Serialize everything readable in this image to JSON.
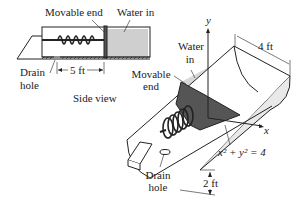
{
  "side_view": {
    "caption": "Side view",
    "movable_end": "Movable end",
    "water_in": "Water in",
    "drain_hole_line1": "Drain",
    "drain_hole_line2": "hole",
    "dimension": "5 ft"
  },
  "main_view": {
    "axis_y": "y",
    "axis_x": "x",
    "water_in_line1": "Water",
    "water_in_line2": "in",
    "movable_end_line1": "Movable",
    "movable_end_line2": "end",
    "width_dimension": "4 ft",
    "equation": "x² + y² = 4",
    "depth_dimension": "2 ft",
    "drain_hole_line1": "Drain",
    "drain_hole_line2": "hole"
  },
  "colors": {
    "water": "#cfcfcf",
    "movable_end": "#555555",
    "line": "#222222"
  }
}
